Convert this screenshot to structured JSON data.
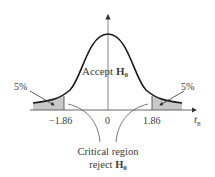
{
  "diagram": {
    "type": "t-distribution two-tailed test",
    "center_label": "Accept",
    "center_h0": "H",
    "h0_sub": "0",
    "left_tail_percent": "5%",
    "right_tail_percent": "5%",
    "tick_left": "−1.86",
    "tick_center": "0",
    "tick_right": "1.86",
    "axis_label": "t",
    "axis_label_sub": "8",
    "critical_line1": "Critical region",
    "critical_line2_prefix": "reject",
    "critical_h0": "H",
    "colors": {
      "curve": "#1a1a1a",
      "axis": "#555555",
      "shade": "#c8c8c8",
      "text": "#3a3a3a"
    }
  }
}
